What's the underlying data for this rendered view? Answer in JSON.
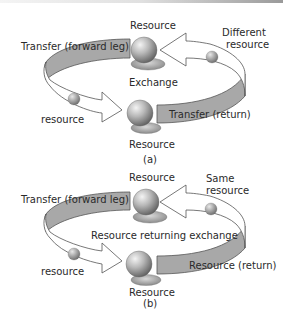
{
  "panel_a": {
    "top_resource": "Resource",
    "bottom_resource": "Resource",
    "forward_leg": "Transfer (forward leg)",
    "return_leg": "Transfer (return)",
    "center": "Exchange",
    "right_resource_line1": "Different",
    "right_resource_line2": "resource",
    "left_resource": "resource",
    "caption": "(a)"
  },
  "panel_b": {
    "top_resource": "Resource",
    "bottom_resource": "Resource",
    "forward_leg": "Transfer (forward leg)",
    "return_leg": "Resource (return)",
    "center": "Resource returning exchange",
    "right_resource_line1": "Same",
    "right_resource_line2": "resource",
    "left_resource": "resource",
    "caption": "(b)"
  },
  "colors": {
    "band_gray": "#a8a8a8",
    "outline": "#555555",
    "sphere": "#8a8a8a"
  }
}
